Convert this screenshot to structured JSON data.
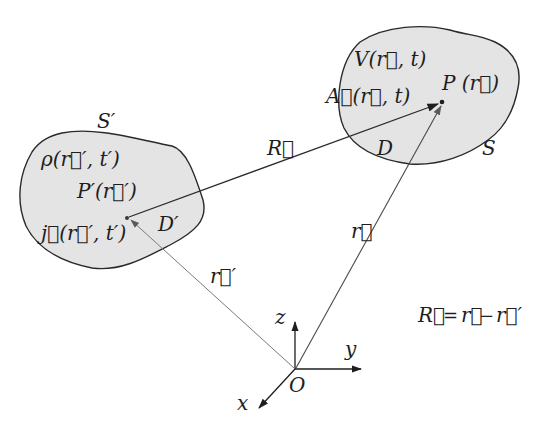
{
  "diagram": {
    "type": "electrodynamics source/field geometry",
    "colors": {
      "background": "#ffffff",
      "region_fill": "#e4e4e4",
      "outline": "#2a2a2a",
      "ink": "#1e1e1e",
      "thin_vector": "#6a6a6a"
    },
    "source_region": {
      "surface_label": "S′",
      "domain_label": "D′",
      "density_label": "ρ(r⃗′, t′)",
      "point_label": "P′(r⃗′)",
      "current_label": "j⃗(r⃗′, t′)"
    },
    "field_region": {
      "surface_label": "S",
      "domain_label": "D",
      "scalar_potential_label": "V(r⃗, t)",
      "vector_potential_label": "A⃗(r⃗, t)",
      "point_label": "P (r⃗)"
    },
    "vectors": {
      "R_label": "R⃗",
      "r_label": "r⃗",
      "r_prime_label": "r⃗′"
    },
    "axes": {
      "origin_label": "O",
      "x_label": "x",
      "y_label": "y",
      "z_label": "z"
    },
    "equation": {
      "lhs": "R⃗",
      "eq": "=",
      "t1": "r⃗",
      "minus": "−",
      "t2": "r⃗′"
    }
  }
}
